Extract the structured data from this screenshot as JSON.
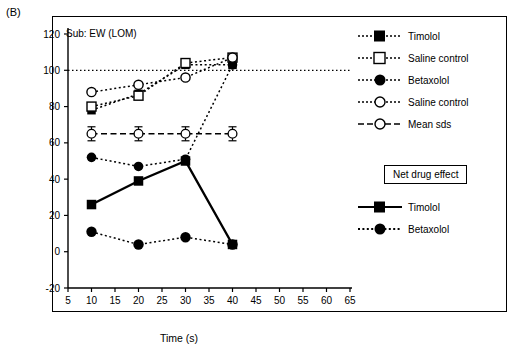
{
  "panel": {
    "label": "(B)"
  },
  "chart_data": {
    "type": "line",
    "title": "Sub: EW (LOM)",
    "xlabel": "Time (s)",
    "ylabel": "Accommodation regression (%)",
    "xlim": [
      5,
      65
    ],
    "ylim": [
      -20,
      120
    ],
    "xticks": [
      5,
      10,
      15,
      20,
      25,
      30,
      35,
      40,
      45,
      50,
      55,
      60,
      65
    ],
    "yticks": [
      -20,
      0,
      20,
      40,
      60,
      80,
      100,
      120
    ],
    "grid": false,
    "legend_position": "right",
    "x": [
      10,
      20,
      30,
      40
    ],
    "series": [
      {
        "name": "Timolol",
        "marker": "filled-square",
        "line": "dotted",
        "group": "main",
        "values": [
          78,
          87,
          103,
          103
        ]
      },
      {
        "name": "Saline control",
        "marker": "open-square",
        "line": "dotted",
        "group": "main",
        "values": [
          80,
          86,
          104,
          107
        ]
      },
      {
        "name": "Betaxolol",
        "marker": "filled-circle",
        "line": "dotted",
        "group": "main",
        "values": [
          52,
          47,
          51,
          103
        ]
      },
      {
        "name": "Saline control",
        "marker": "open-circle",
        "line": "dotted",
        "group": "main",
        "values": [
          88,
          92,
          96,
          107
        ]
      },
      {
        "name": "Mean sds",
        "marker": "open-circle-error",
        "line": "dashed",
        "group": "main",
        "values": [
          65,
          65,
          65,
          65
        ]
      },
      {
        "name": "Timolol",
        "marker": "filled-square",
        "line": "solid",
        "group": "net",
        "values": [
          26,
          39,
          50,
          4
        ]
      },
      {
        "name": "Betaxolol",
        "marker": "filled-circle",
        "line": "dotted",
        "group": "net",
        "values": [
          11,
          4,
          8,
          4
        ]
      }
    ],
    "reference_line": {
      "y": 100,
      "style": "dotted"
    },
    "annotations": {
      "net_drug_effect": "Net drug effect"
    }
  },
  "legend": {
    "main": [
      {
        "label": "Timolol"
      },
      {
        "label": "Saline control"
      },
      {
        "label": "Betaxolol"
      },
      {
        "label": "Saline control"
      },
      {
        "label": "Mean sds"
      }
    ],
    "net_title": "Net drug effect",
    "net": [
      {
        "label": "Timolol"
      },
      {
        "label": "Betaxolol"
      }
    ]
  }
}
